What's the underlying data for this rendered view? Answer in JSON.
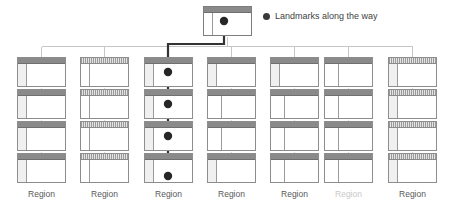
{
  "diagram": {
    "type": "sitemap-hierarchy",
    "background_color": "#ffffff",
    "connector_color": "#c2c2c2",
    "path_color": "#333333",
    "card_border_color": "#8d8d8d",
    "card_header_color": "#8a8a8a"
  },
  "legend": {
    "marker": "filled-circle",
    "marker_color": "#3a3a3a",
    "text": "Landmarks along the way"
  },
  "root_node": {
    "name": "home-page-card",
    "header_style": "solid",
    "sidebar_style": "plain",
    "has_landmark": true,
    "x": 203,
    "y": 6,
    "width": 49,
    "height": 30
  },
  "columns": [
    {
      "index": 1,
      "label": "Region",
      "label_faded": false,
      "x": 17,
      "header_style": "solid",
      "sidebar_styles": [
        "shaded",
        "shaded",
        "shaded",
        "shaded"
      ]
    },
    {
      "index": 2,
      "label": "Region",
      "label_faded": false,
      "x": 80,
      "header_style": "hatched",
      "sidebar_styles": [
        "plain",
        "plain",
        "plain",
        "plain"
      ]
    },
    {
      "index": 3,
      "label": "Region",
      "label_faded": false,
      "x": 144,
      "header_style": "solid",
      "sidebar_styles": [
        "shaded",
        "shaded",
        "shaded",
        "shaded"
      ]
    },
    {
      "index": 4,
      "label": "Region",
      "label_faded": false,
      "x": 207,
      "header_style": "solid",
      "sidebar_styles": [
        "shaded",
        "plain",
        "plain",
        "shaded"
      ]
    },
    {
      "index": 5,
      "label": "Region",
      "label_faded": false,
      "x": 270,
      "header_style": "solid",
      "sidebar_styles": [
        "shaded",
        "plain",
        "plain",
        "plain"
      ]
    },
    {
      "index": 6,
      "label": "Region",
      "label_faded": true,
      "x": 324,
      "header_style": "solid",
      "sidebar_styles": [
        "plain",
        "plain",
        "plain",
        "plain"
      ]
    },
    {
      "index": 7,
      "label": "Region",
      "label_faded": false,
      "x": 388,
      "header_style": "hatched",
      "sidebar_styles": [
        "shaded",
        "shaded",
        "shaded",
        "shaded"
      ]
    }
  ],
  "rows": {
    "count": 4,
    "y_positions": [
      57,
      89,
      121,
      153
    ],
    "card_width": 49,
    "card_height": 30
  },
  "path": {
    "description": "highlighted user journey from home page down through third region column",
    "landmark_count": 5,
    "landmarks": [
      {
        "x": 224,
        "y": 21,
        "location": "root-card"
      },
      {
        "x": 168,
        "y": 72,
        "location": "column-3-row-1"
      },
      {
        "x": 168,
        "y": 104,
        "location": "column-3-row-2"
      },
      {
        "x": 168,
        "y": 136,
        "location": "column-3-row-3"
      },
      {
        "x": 168,
        "y": 175,
        "location": "column-3-row-4"
      }
    ],
    "arrow_end": {
      "x": 168,
      "y": 166
    }
  },
  "region_labels_y": 195
}
